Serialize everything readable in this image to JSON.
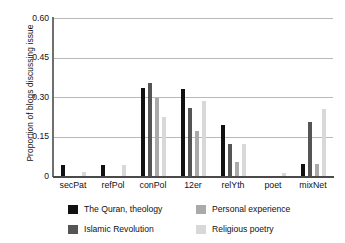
{
  "chart_data": {
    "type": "bar",
    "title": "",
    "xlabel": "",
    "ylabel": "Proportion of blogs discussing issue",
    "ylim": [
      0,
      0.6
    ],
    "yticks": [
      "0",
      "0.15",
      "0.30",
      "0.45",
      "0.60"
    ],
    "ytick_values": [
      0,
      0.15,
      0.3,
      0.45,
      0.6
    ],
    "grid": true,
    "legend_position": "bottom",
    "categories": [
      "secPat",
      "refPol",
      "conPol",
      "12er",
      "relYth",
      "poet",
      "mixNet"
    ],
    "series": [
      {
        "name": "The Quran, theology",
        "color": "#111111",
        "values": [
          0.04,
          0.043,
          0.335,
          0.33,
          0.195,
          0.0,
          0.047
        ]
      },
      {
        "name": "Islamic Revolution",
        "color": "#555555",
        "values": [
          0.0,
          0.0,
          0.355,
          0.26,
          0.12,
          0.0,
          0.205
        ]
      },
      {
        "name": "Personal experience",
        "color": "#aaaaaa",
        "values": [
          0.0,
          0.0,
          0.297,
          0.172,
          0.052,
          0.0,
          0.047
        ]
      },
      {
        "name": "Religious poetry",
        "color": "#d8d8d8",
        "values": [
          0.014,
          0.042,
          0.225,
          0.285,
          0.12,
          0.013,
          0.255
        ]
      }
    ]
  }
}
